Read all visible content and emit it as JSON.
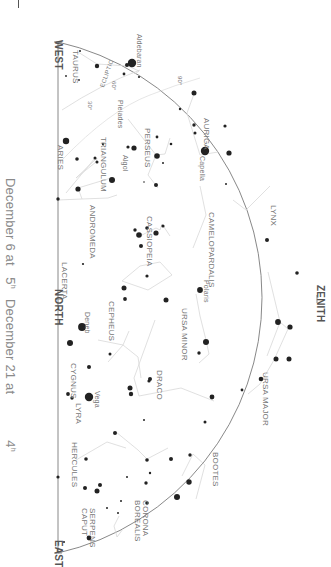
{
  "caption": {
    "line1_date": "December 6 at",
    "line1_time": "5",
    "line1_sup": "h",
    "line2_date": "December 21 at",
    "line2_time": "4",
    "line2_sup": "h"
  },
  "directions": {
    "west": "WEST",
    "north": "NORTH",
    "east": "EAST",
    "zenith": "ZENITH"
  },
  "constellations": {
    "taurus": "TAURUS",
    "aries": "ARIES",
    "triangulum": "TRIANGULUM",
    "perseus": "PERSEUS",
    "auriga": "AURIGA",
    "andromeda": "ANDROMEDA",
    "cassiopeia": "CASSIOPEIA",
    "camelopardalis": "CAMELOPARDALIS",
    "lynx": "LYNX",
    "lacerta": "LACERTA",
    "cepheus": "CEPHEUS",
    "ursa_minor": "URSA MINOR",
    "ursa_major": "URSA MAJOR",
    "draco": "DRACO",
    "cygnus": "CYGNUS",
    "lyra": "LYRA",
    "hercules": "HERCULES",
    "bootes": "BOOTES",
    "corona_borealis": "CORONA BOREALIS",
    "serpens_caput": "SERPENS CAPUT"
  },
  "stars": {
    "aldebaran": "Aldebaran",
    "pleiades": "Pleiades",
    "algol": "Algol",
    "capella": "Capella",
    "polaris": "Polaris",
    "deneb": "Deneb",
    "vega": "Vega"
  },
  "ecliptic": {
    "label": "ECLIPTIC",
    "marks": [
      "30°",
      "60°",
      "90°"
    ]
  },
  "colors": {
    "horizon": "#777777",
    "lines": "#d6d6d6",
    "stars": "#222222",
    "labels": "#777777"
  }
}
